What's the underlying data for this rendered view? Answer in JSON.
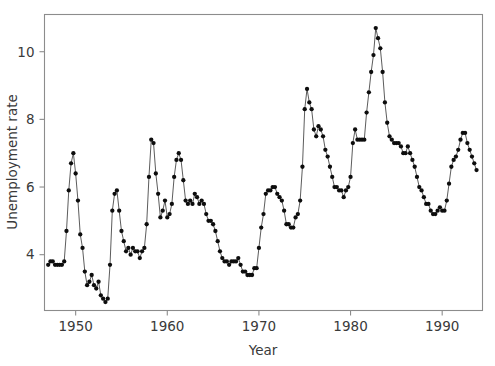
{
  "chart_data": {
    "type": "line",
    "title": "",
    "subtitle": "",
    "xlabel": "Year",
    "ylabel": "Unemployment rate",
    "xlim": [
      1946.6,
      1994.4
    ],
    "ylim": [
      2.35,
      11.1
    ],
    "xticks": [
      1950,
      1960,
      1970,
      1980,
      1990
    ],
    "xtick_labels": [
      "1950",
      "1960",
      "1970",
      "1980",
      "1990"
    ],
    "yticks": [
      4,
      6,
      8,
      10
    ],
    "ytick_labels": [
      "4",
      "6",
      "8",
      "10"
    ],
    "grid": false,
    "legend": false,
    "legend_position": "none",
    "marker": "filled-circle",
    "marker_color": "#0d0d0d",
    "line_color": "#4a4a4a",
    "frame_color": "#8c8c8c",
    "series": [
      {
        "name": "Unemployment rate",
        "x": [
          1947.0,
          1947.25,
          1947.5,
          1947.75,
          1948.0,
          1948.25,
          1948.5,
          1948.75,
          1949.0,
          1949.25,
          1949.5,
          1949.75,
          1950.0,
          1950.25,
          1950.5,
          1950.75,
          1951.0,
          1951.25,
          1951.5,
          1951.75,
          1952.0,
          1952.25,
          1952.5,
          1952.75,
          1953.0,
          1953.25,
          1953.5,
          1953.75,
          1954.0,
          1954.25,
          1954.5,
          1954.75,
          1955.0,
          1955.25,
          1955.5,
          1955.75,
          1956.0,
          1956.25,
          1956.5,
          1956.75,
          1957.0,
          1957.25,
          1957.5,
          1957.75,
          1958.0,
          1958.25,
          1958.5,
          1958.75,
          1959.0,
          1959.25,
          1959.5,
          1959.75,
          1960.0,
          1960.25,
          1960.5,
          1960.75,
          1961.0,
          1961.25,
          1961.5,
          1961.75,
          1962.0,
          1962.25,
          1962.5,
          1962.75,
          1963.0,
          1963.25,
          1963.5,
          1963.75,
          1964.0,
          1964.25,
          1964.5,
          1964.75,
          1965.0,
          1965.25,
          1965.5,
          1965.75,
          1966.0,
          1966.25,
          1966.5,
          1966.75,
          1967.0,
          1967.25,
          1967.5,
          1967.75,
          1968.0,
          1968.25,
          1968.5,
          1968.75,
          1969.0,
          1969.25,
          1969.5,
          1969.75,
          1970.0,
          1970.25,
          1970.5,
          1970.75,
          1971.0,
          1971.25,
          1971.5,
          1971.75,
          1972.0,
          1972.25,
          1972.5,
          1972.75,
          1973.0,
          1973.25,
          1973.5,
          1973.75,
          1974.0,
          1974.25,
          1974.5,
          1974.75,
          1975.0,
          1975.25,
          1975.5,
          1975.75,
          1976.0,
          1976.25,
          1976.5,
          1976.75,
          1977.0,
          1977.25,
          1977.5,
          1977.75,
          1978.0,
          1978.25,
          1978.5,
          1978.75,
          1979.0,
          1979.25,
          1979.5,
          1979.75,
          1980.0,
          1980.25,
          1980.5,
          1980.75,
          1981.0,
          1981.25,
          1981.5,
          1981.75,
          1982.0,
          1982.25,
          1982.5,
          1982.75,
          1983.0,
          1983.25,
          1983.5,
          1983.75,
          1984.0,
          1984.25,
          1984.5,
          1984.75,
          1985.0,
          1985.25,
          1985.5,
          1985.75,
          1986.0,
          1986.25,
          1986.5,
          1986.75,
          1987.0,
          1987.25,
          1987.5,
          1987.75,
          1988.0,
          1988.25,
          1988.5,
          1988.75,
          1989.0,
          1989.25,
          1989.5,
          1989.75,
          1990.0,
          1990.25,
          1990.5,
          1990.75,
          1991.0,
          1991.25,
          1991.5,
          1991.75,
          1992.0,
          1992.25,
          1992.5,
          1992.75,
          1993.0,
          1993.25,
          1993.5,
          1993.75
        ],
        "values": [
          3.7,
          3.8,
          3.8,
          3.7,
          3.7,
          3.7,
          3.7,
          3.8,
          4.7,
          5.9,
          6.7,
          7.0,
          6.4,
          5.6,
          4.6,
          4.2,
          3.5,
          3.1,
          3.2,
          3.4,
          3.1,
          3.0,
          3.2,
          2.8,
          2.7,
          2.6,
          2.7,
          3.7,
          5.3,
          5.8,
          5.9,
          5.3,
          4.7,
          4.4,
          4.1,
          4.2,
          4.0,
          4.2,
          4.1,
          4.1,
          3.9,
          4.1,
          4.2,
          4.9,
          6.3,
          7.4,
          7.3,
          6.4,
          5.8,
          5.1,
          5.3,
          5.6,
          5.1,
          5.2,
          5.5,
          6.3,
          6.8,
          7.0,
          6.8,
          6.2,
          5.6,
          5.5,
          5.6,
          5.5,
          5.8,
          5.7,
          5.5,
          5.6,
          5.5,
          5.2,
          5.0,
          5.0,
          4.9,
          4.7,
          4.4,
          4.1,
          3.9,
          3.8,
          3.8,
          3.7,
          3.8,
          3.8,
          3.8,
          3.9,
          3.7,
          3.5,
          3.5,
          3.4,
          3.4,
          3.4,
          3.6,
          3.6,
          4.2,
          4.8,
          5.2,
          5.8,
          5.9,
          5.9,
          6.0,
          6.0,
          5.8,
          5.7,
          5.6,
          5.3,
          4.9,
          4.9,
          4.8,
          4.8,
          5.1,
          5.2,
          5.6,
          6.6,
          8.3,
          8.9,
          8.5,
          8.3,
          7.7,
          7.5,
          7.8,
          7.7,
          7.5,
          7.1,
          6.9,
          6.6,
          6.3,
          6.0,
          6.0,
          5.9,
          5.9,
          5.7,
          5.9,
          6.0,
          6.3,
          7.3,
          7.7,
          7.4,
          7.4,
          7.4,
          7.4,
          8.2,
          8.8,
          9.4,
          9.9,
          10.7,
          10.4,
          10.1,
          9.4,
          8.5,
          7.9,
          7.5,
          7.4,
          7.3,
          7.3,
          7.3,
          7.2,
          7.0,
          7.0,
          7.2,
          7.0,
          6.8,
          6.6,
          6.3,
          6.0,
          5.9,
          5.7,
          5.5,
          5.5,
          5.3,
          5.2,
          5.2,
          5.3,
          5.4,
          5.3,
          5.3,
          5.6,
          6.1,
          6.6,
          6.8,
          6.9,
          7.1,
          7.4,
          7.6,
          7.6,
          7.3,
          7.1,
          6.9,
          6.7,
          6.5
        ]
      }
    ]
  },
  "axes": {
    "y_title": "Unemployment rate",
    "x_title": "Year"
  }
}
